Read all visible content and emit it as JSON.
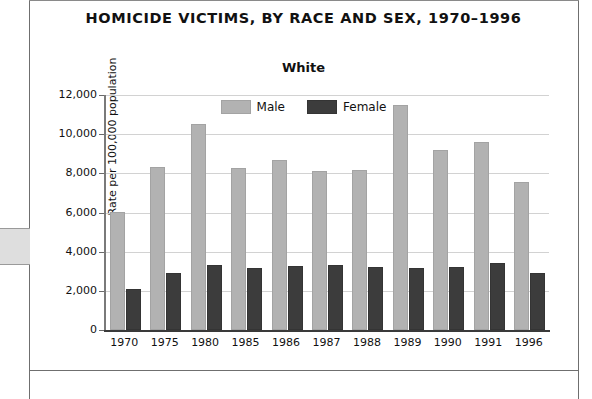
{
  "document": {
    "thumb_tab_label": ""
  },
  "chart_data": {
    "type": "bar",
    "title": "HOMICIDE VICTIMS, BY RACE AND SEX, 1970–1996",
    "subtitle": "White",
    "xlabel": "",
    "ylabel": "Rate per 100,000 population",
    "categories": [
      "1970",
      "1975",
      "1980",
      "1985",
      "1986",
      "1987",
      "1988",
      "1989",
      "1990",
      "1991",
      "1996"
    ],
    "series": [
      {
        "name": "Male",
        "color": "#b2b2b2",
        "values": [
          5900,
          8200,
          10400,
          8150,
          8600,
          8000,
          8050,
          11400,
          9100,
          9500,
          7450
        ]
      },
      {
        "name": "Female",
        "color": "#3c3c3c",
        "values": [
          2000,
          2800,
          3200,
          3050,
          3150,
          3200,
          3100,
          3050,
          3100,
          3300,
          2800
        ]
      }
    ],
    "ylim": [
      0,
      12000
    ],
    "ytick_values": [
      0,
      2000,
      4000,
      6000,
      8000,
      10000,
      12000
    ],
    "ytick_labels": [
      "0",
      "2,000",
      "4,000",
      "6,000",
      "8,000",
      "10,000",
      "12,000"
    ],
    "grid": true,
    "legend_position": "top-center",
    "legend_entries": [
      "Male",
      "Female"
    ]
  }
}
